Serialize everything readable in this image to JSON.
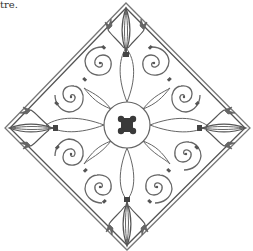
{
  "caption": {
    "text": "tre."
  },
  "illustration": {
    "subject": "wrought-iron-diamond-panel",
    "stroke_color": "#555555",
    "dark_color": "#3a3a3a",
    "vertices": {
      "top": [
        126,
        3
      ],
      "right": [
        250,
        128
      ],
      "bottom": [
        127,
        250
      ],
      "left": [
        5,
        128
      ]
    },
    "center": [
      127,
      125
    ],
    "center_ring_radius": 23,
    "scrolls": [
      {
        "quadrant": "upper-left",
        "centers": [
          [
            100,
            63
          ],
          [
            71,
            97
          ]
        ]
      },
      {
        "quadrant": "upper-right",
        "centers": [
          [
            154,
            63
          ],
          [
            184,
            97
          ]
        ]
      },
      {
        "quadrant": "lower-left",
        "centers": [
          [
            71,
            154
          ],
          [
            100,
            187
          ]
        ]
      },
      {
        "quadrant": "lower-right",
        "centers": [
          [
            186,
            154
          ],
          [
            157,
            187
          ]
        ]
      }
    ]
  }
}
